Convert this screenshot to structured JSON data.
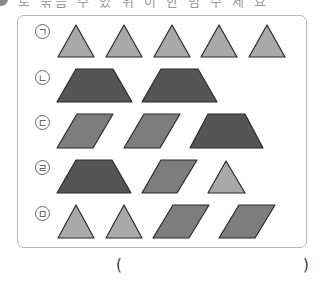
{
  "header": {
    "cut_text": "로 묶음 수 있 위 이 한 임 수 세 요",
    "badge": ""
  },
  "rows": [
    {
      "label": "ㄱ",
      "shapes": [
        "triangle",
        "triangle",
        "triangle",
        "triangle",
        "triangle"
      ]
    },
    {
      "label": "ㄴ",
      "shapes": [
        "trapezoid",
        "trapezoid"
      ]
    },
    {
      "label": "ㄷ",
      "shapes": [
        "parallelogram",
        "parallelogram",
        "trapezoid"
      ]
    },
    {
      "label": "ㄹ",
      "shapes": [
        "trapezoid",
        "parallelogram",
        "triangle"
      ]
    },
    {
      "label": "ㅁ",
      "shapes": [
        "triangle",
        "triangle",
        "parallelogram",
        "parallelogram"
      ]
    }
  ],
  "answer": {
    "open": "(",
    "close": ")",
    "value": ""
  },
  "colors": {
    "triangle": "#a9a9a9",
    "parallelogram": "#7d7d7d",
    "trapezoid": "#555555",
    "stroke": "#2a2a2a",
    "border": "#b5b5b5"
  }
}
